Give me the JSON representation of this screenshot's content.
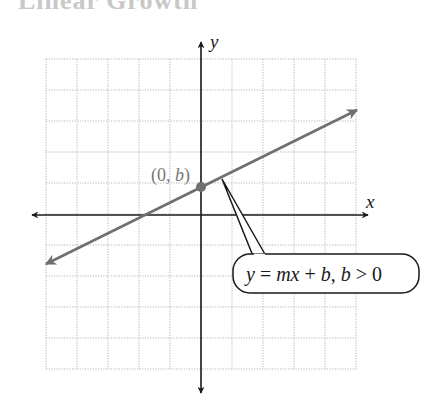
{
  "header": {
    "clipped_title": "Linear Growth"
  },
  "colors": {
    "background": "#ffffff",
    "grid": "#b5b5b5",
    "axis": "#1a1a1a",
    "line": "#6f6f6f",
    "point": "#6f6f6f",
    "point_label": "#777777",
    "callout_border": "#1a1a1a",
    "callout_text": "#1a1a1a"
  },
  "diagram": {
    "axis_labels": {
      "x": "x",
      "y": "y"
    },
    "point_label": "(0, b)",
    "callout_text": "y = mx + b, b > 0",
    "grid": {
      "cols": 10,
      "rows": 10,
      "left": 46,
      "top": 59,
      "cell": 31
    },
    "origin_px": {
      "x": 201,
      "y": 215
    }
  },
  "chart_data": {
    "type": "line",
    "title": "",
    "xlabel": "x",
    "ylabel": "y",
    "grid": true,
    "xlim": [
      -5,
      5
    ],
    "ylim": [
      -5,
      5
    ],
    "series": [
      {
        "name": "y = mx + b, b > 0",
        "slope": 0.5,
        "intercept": 0.9,
        "x": [
          -5,
          5
        ],
        "y": [
          -1.6,
          3.4
        ]
      }
    ],
    "annotations": [
      {
        "text": "(0, b)",
        "x": 0,
        "y": 0.9,
        "kind": "point"
      },
      {
        "text": "y = mx + b, b > 0",
        "kind": "callout",
        "points_to": {
          "x": 0.7,
          "y": 1.2
        }
      }
    ]
  }
}
